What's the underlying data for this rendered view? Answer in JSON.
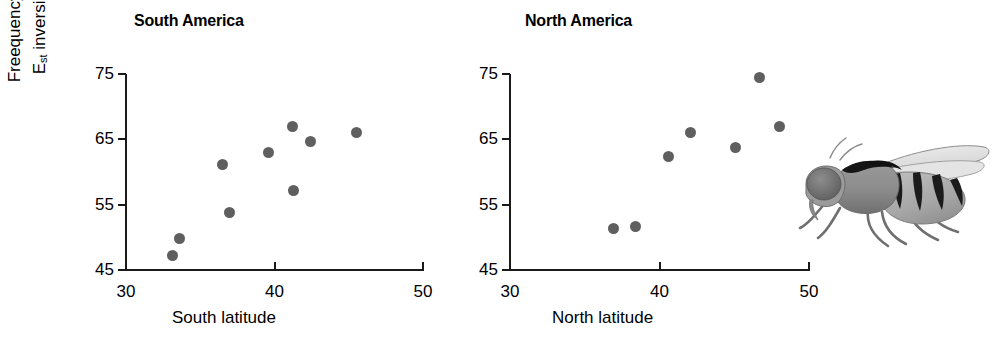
{
  "figure": {
    "y_axis_title_line1": "Freequency of",
    "y_axis_title_line2_base": "E",
    "y_axis_title_line2_sub": "st",
    "y_axis_title_line2_rest": " inversion",
    "point_color": "#5f5f5f",
    "axis_color": "#1a1a1a"
  },
  "panels": [
    {
      "key": "south",
      "title": "South America",
      "xlabel": "South latitude",
      "ylabel": "Freequency of Est inversion",
      "xticks": [
        "30",
        "40",
        "50"
      ],
      "yticks": [
        "75",
        "65",
        "55",
        "45"
      ]
    },
    {
      "key": "north",
      "title": "North America",
      "xlabel": "North latitude",
      "ylabel": "Freequency of Est inversion",
      "xticks": [
        "30",
        "40",
        "50"
      ],
      "yticks": [
        "75",
        "65",
        "55",
        "45"
      ]
    }
  ],
  "illustration": {
    "name": "drosophila-fly",
    "caption": "Drosophila fly illustration, grayscale, facing left"
  },
  "chart_data": [
    {
      "type": "scatter",
      "title": "South America",
      "xlabel": "South latitude",
      "ylabel": "Freequency of Est inversion",
      "xlim": [
        30,
        50
      ],
      "ylim": [
        45,
        75
      ],
      "xticks": [
        30,
        40,
        50
      ],
      "yticks": [
        45,
        55,
        65,
        75
      ],
      "grid": false,
      "legend": false,
      "points": [
        {
          "x": 33.1,
          "y": 47.2
        },
        {
          "x": 33.6,
          "y": 49.8
        },
        {
          "x": 36.5,
          "y": 61.2
        },
        {
          "x": 37.0,
          "y": 53.8
        },
        {
          "x": 39.6,
          "y": 63.0
        },
        {
          "x": 41.2,
          "y": 66.9
        },
        {
          "x": 41.3,
          "y": 57.2
        },
        {
          "x": 42.4,
          "y": 64.6
        },
        {
          "x": 45.5,
          "y": 66.1
        }
      ]
    },
    {
      "type": "scatter",
      "title": "North America",
      "xlabel": "North latitude",
      "ylabel": "Freequency of Est inversion",
      "xlim": [
        30,
        50
      ],
      "ylim": [
        45,
        75
      ],
      "xticks": [
        30,
        40,
        50
      ],
      "yticks": [
        45,
        55,
        65,
        75
      ],
      "grid": false,
      "legend": false,
      "points": [
        {
          "x": 36.9,
          "y": 51.4
        },
        {
          "x": 38.4,
          "y": 51.6
        },
        {
          "x": 40.6,
          "y": 62.3
        },
        {
          "x": 42.1,
          "y": 66.0
        },
        {
          "x": 45.1,
          "y": 63.7
        },
        {
          "x": 46.7,
          "y": 74.4
        },
        {
          "x": 48.0,
          "y": 67.0
        }
      ]
    }
  ]
}
